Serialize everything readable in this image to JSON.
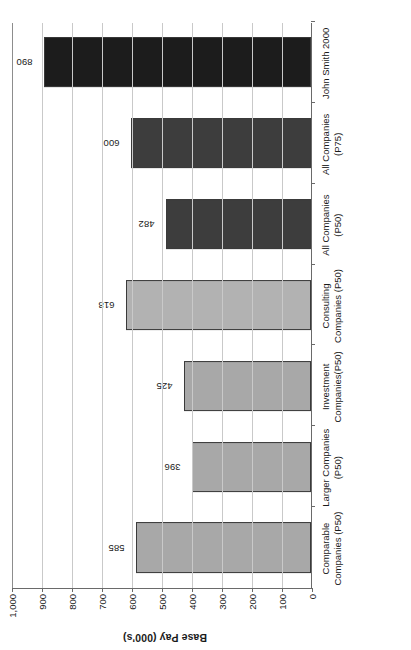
{
  "chart_data": {
    "type": "bar",
    "title": "",
    "xlabel": "",
    "ylabel": "Base Pay (000's)",
    "ylim": [
      0,
      1000
    ],
    "ytick_labels": [
      "1,000",
      "900",
      "800",
      "700",
      "600",
      "500",
      "400",
      "300",
      "200",
      "100",
      "0"
    ],
    "ytick_values": [
      1000,
      900,
      800,
      700,
      600,
      500,
      400,
      300,
      200,
      100,
      0
    ],
    "grid": true,
    "legend": "none",
    "orientation": "vertical-columns-rotated-90ccw",
    "categories": [
      "Comparable Companies (P50)",
      "Larger Companies (P50)",
      "Investment Companies(P50)",
      "Consulting Companies (P50)",
      "All Companies (P50)",
      "All Companies (P75)",
      "John Smith 2000"
    ],
    "category_lines": [
      [
        "Comparable",
        "Companies (P50)"
      ],
      [
        "Larger Companies",
        "(P50)"
      ],
      [
        "Investment",
        "Companies(P50)"
      ],
      [
        "Consulting",
        "Companies (P50)"
      ],
      [
        "All Companies",
        "(P50)"
      ],
      [
        "All Companies",
        "(P75)"
      ],
      [
        "John Smith 2000"
      ]
    ],
    "values": [
      585,
      396,
      425,
      618,
      482,
      600,
      890
    ],
    "value_labels": [
      "585",
      "396",
      "425",
      "618",
      "482",
      "600",
      "890"
    ],
    "bar_colors": [
      "#a8a8a8",
      "#a8a8a8",
      "#a8a8a8",
      "#b2b2b2",
      "#3d3d3d",
      "#3d3d3d",
      "#1c1c1c"
    ],
    "bar_edge_color": "#3a3a3a",
    "axis_color": "#6a6a6a",
    "grid_color": "#c9c9c9",
    "text_color": "#1a1a1a"
  }
}
